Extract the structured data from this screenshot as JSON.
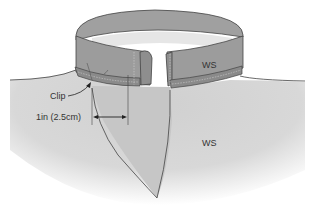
{
  "diagram": {
    "labels": {
      "collar_side": "WS",
      "body_side": "WS",
      "clip": "Clip",
      "measurement": "1in (2.5cm)"
    },
    "colors": {
      "background": "#ffffff",
      "body_fabric": "#d4d4d4",
      "body_shadow": "#ffffff",
      "collar_outer": "#9a9a9a",
      "collar_inner": "#e4e4e4",
      "collar_band_edge": "#8a8a8a",
      "facing_flap": "#c2c2c2",
      "outline": "#444444",
      "text": "#333333"
    }
  }
}
